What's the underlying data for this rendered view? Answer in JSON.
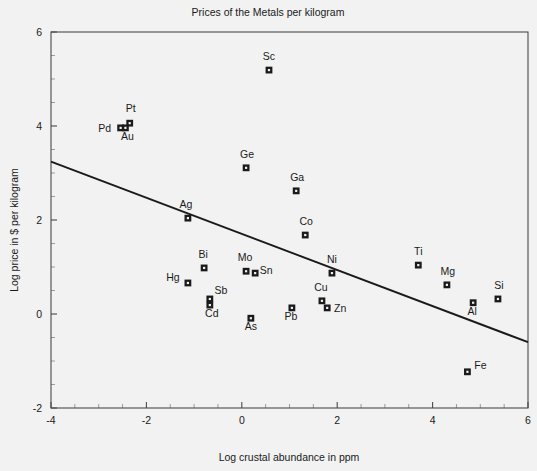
{
  "chart_data": {
    "type": "scatter",
    "title": "Prices of the Metals per kilogram",
    "xlabel": "Log crustal abundance in ppm",
    "ylabel": "Log price in $ per kilogram",
    "xlim": [
      -4,
      6
    ],
    "ylim": [
      -2,
      6
    ],
    "xticks": [
      -4,
      -2,
      0,
      2,
      4,
      6
    ],
    "xticklabels": [
      "-4",
      "-2",
      "0",
      "2",
      "4",
      "6"
    ],
    "yticks": [
      -2,
      0,
      2,
      4,
      6
    ],
    "yticklabels": [
      "-2",
      "0",
      "2",
      "4",
      "6"
    ],
    "x_minor_tick_step": 0.5,
    "y_minor_tick_step": 0.5,
    "grid": false,
    "legend": "none",
    "marker": "square-with-white-center",
    "points": [
      {
        "label": "Sc",
        "x": 0.57,
        "y": 5.19,
        "label_dx": 0,
        "label_dy": -10
      },
      {
        "label": "Pt",
        "x": -2.35,
        "y": 4.06,
        "label_dx": 1,
        "label_dy": -11
      },
      {
        "label": "Pd",
        "x": -2.54,
        "y": 3.96,
        "label_dx": -16,
        "label_dy": 4
      },
      {
        "label": "Au",
        "x": -2.44,
        "y": 3.96,
        "label_dx": 2,
        "label_dy": 12
      },
      {
        "label": "Ge",
        "x": 0.09,
        "y": 3.11,
        "label_dx": 1,
        "label_dy": -10
      },
      {
        "label": "Ga",
        "x": 1.14,
        "y": 2.62,
        "label_dx": 1,
        "label_dy": -10
      },
      {
        "label": "Ag",
        "x": -1.13,
        "y": 2.04,
        "label_dx": -2,
        "label_dy": -10
      },
      {
        "label": "Co",
        "x": 1.33,
        "y": 1.68,
        "label_dx": 1,
        "label_dy": -10
      },
      {
        "label": "Ti",
        "x": 3.7,
        "y": 1.04,
        "label_dx": 0,
        "label_dy": -10
      },
      {
        "label": "Bi",
        "x": -0.79,
        "y": 0.98,
        "label_dx": -1,
        "label_dy": -10
      },
      {
        "label": "Ni",
        "x": 1.89,
        "y": 0.87,
        "label_dx": 0,
        "label_dy": -10
      },
      {
        "label": "Mo",
        "x": 0.09,
        "y": 0.91,
        "label_dx": -1,
        "label_dy": -10
      },
      {
        "label": "Sn",
        "x": 0.28,
        "y": 0.87,
        "label_dx": 11,
        "label_dy": 1
      },
      {
        "label": "Hg",
        "x": -1.13,
        "y": 0.66,
        "label_dx": -15,
        "label_dy": -2
      },
      {
        "label": "Mg",
        "x": 4.3,
        "y": 0.62,
        "label_dx": 1,
        "label_dy": -10
      },
      {
        "label": "Sb",
        "x": -0.67,
        "y": 0.32,
        "label_dx": 11,
        "label_dy": -5
      },
      {
        "label": "Cu",
        "x": 1.68,
        "y": 0.28,
        "label_dx": -1,
        "label_dy": -10
      },
      {
        "label": "Si",
        "x": 5.37,
        "y": 0.32,
        "label_dx": 1,
        "label_dy": -10
      },
      {
        "label": "Cd",
        "x": -0.67,
        "y": 0.19,
        "label_dx": 2,
        "label_dy": 12
      },
      {
        "label": "Zn",
        "x": 1.79,
        "y": 0.13,
        "label_dx": 13,
        "label_dy": 4
      },
      {
        "label": "Al",
        "x": 4.85,
        "y": 0.24,
        "label_dx": -1,
        "label_dy": 12
      },
      {
        "label": "Pb",
        "x": 1.05,
        "y": 0.13,
        "label_dx": -1,
        "label_dy": 12
      },
      {
        "label": "As",
        "x": 0.19,
        "y": -0.09,
        "label_dx": 0,
        "label_dy": 12
      },
      {
        "label": "Fe",
        "x": 4.73,
        "y": -1.23,
        "label_dx": 13,
        "label_dy": -3
      }
    ],
    "trend_line": {
      "x_start": -4,
      "y_start": 3.24,
      "x_end": 6,
      "y_end": -0.6
    }
  }
}
